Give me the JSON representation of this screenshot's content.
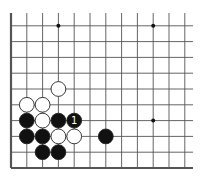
{
  "diagram": {
    "type": "go-board-fragment",
    "visible_columns": 12,
    "visible_rows": 10,
    "edges": [
      "left",
      "bottom"
    ],
    "star_points": [
      [
        3,
        9
      ],
      [
        9,
        9
      ],
      [
        9,
        3
      ]
    ],
    "stones": [
      {
        "color": "white",
        "col": 3,
        "row": 5
      },
      {
        "color": "white",
        "col": 1,
        "row": 4
      },
      {
        "color": "white",
        "col": 2,
        "row": 4
      },
      {
        "color": "black",
        "col": 1,
        "row": 3
      },
      {
        "color": "white",
        "col": 2,
        "row": 3
      },
      {
        "color": "black",
        "col": 3,
        "row": 3
      },
      {
        "color": "black",
        "col": 4,
        "row": 3,
        "label": "1"
      },
      {
        "color": "black",
        "col": 1,
        "row": 2
      },
      {
        "color": "black",
        "col": 2,
        "row": 2
      },
      {
        "color": "white",
        "col": 3,
        "row": 2
      },
      {
        "color": "white",
        "col": 4,
        "row": 2
      },
      {
        "color": "black",
        "col": 6,
        "row": 2
      },
      {
        "color": "black",
        "col": 2,
        "row": 1
      },
      {
        "color": "black",
        "col": 3,
        "row": 1
      }
    ]
  }
}
